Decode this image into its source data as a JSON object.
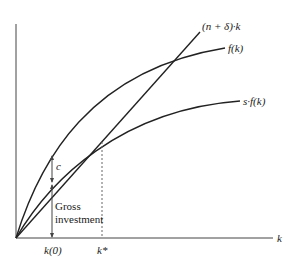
{
  "diagram": {
    "curves": {
      "depreciation_line": {
        "label": "(n + δ)·k"
      },
      "production": {
        "label": "f(k)"
      },
      "saving": {
        "label": "s·f(k)"
      }
    },
    "annotations": {
      "consumption": "c",
      "gross_investment_line1": "Gross",
      "gross_investment_line2": "investment"
    },
    "axes": {
      "x_label": "k",
      "ticks": {
        "k0": "k(0)",
        "kstar": "k*"
      }
    },
    "colors": {
      "stroke": "#222222",
      "dashed": "#555555",
      "background": "#ffffff"
    }
  }
}
